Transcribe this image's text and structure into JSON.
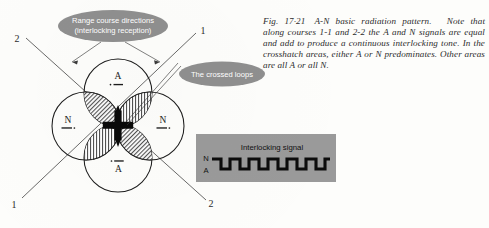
{
  "figure": {
    "number": "Fig. 17·21",
    "title": "A-N basic radiation pattern.",
    "caption_body": "Note that along courses 1-1 and 2-2 the A and N signals are equal and add to produce a continuous interlocking tone. In the crosshatch areas, either A or N predominates. Other areas are all A or all N."
  },
  "callouts": [
    {
      "id": "range-course",
      "line1": "Range course directions",
      "line2": "(interlocking reception)"
    },
    {
      "id": "crossed-loops",
      "line1": "The crossed loops",
      "line2": ""
    }
  ],
  "diagram": {
    "lobes": [
      {
        "position": "top",
        "label": "A",
        "morse": "·—"
      },
      {
        "position": "bottom",
        "label": "A",
        "morse": "·—"
      },
      {
        "position": "left",
        "label": "N",
        "morse": "—·"
      },
      {
        "position": "right",
        "label": "N",
        "morse": "—·"
      }
    ],
    "course_labels": [
      {
        "corner": "top-left",
        "text": "2"
      },
      {
        "corner": "top-right",
        "text": "1"
      },
      {
        "corner": "bottom-left",
        "text": "1"
      },
      {
        "corner": "bottom-right",
        "text": "2"
      }
    ]
  },
  "signal_box": {
    "title": "Interlocking signal",
    "axis_high": "N",
    "axis_low": "A",
    "waveform_cycles": 6
  },
  "colors": {
    "page_background": "#fdfdfb",
    "ink": "#1c1c1c",
    "callout_fill": "#8f8f8f",
    "callout_text": "#ffffff",
    "signal_box_fill": "#9a9a9a",
    "hatch": "#1c1c1c"
  }
}
